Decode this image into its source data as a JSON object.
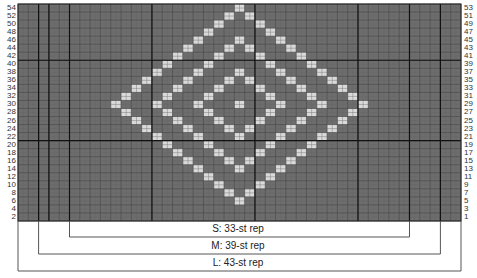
{
  "chart": {
    "columns": 43,
    "rows": 27,
    "left_row_labels": [
      "54",
      "52",
      "50",
      "48",
      "46",
      "44",
      "42",
      "40",
      "38",
      "36",
      "34",
      "32",
      "30",
      "28",
      "26",
      "24",
      "22",
      "20",
      "18",
      "16",
      "14",
      "12",
      "10",
      "8",
      "6",
      "4",
      "2"
    ],
    "right_row_labels": [
      "53",
      "51",
      "49",
      "47",
      "45",
      "43",
      "41",
      "39",
      "37",
      "35",
      "33",
      "31",
      "29",
      "27",
      "25",
      "23",
      "21",
      "19",
      "17",
      "15",
      "13",
      "11",
      "9",
      "7",
      "5",
      "3",
      "1"
    ],
    "colors": {
      "background": "#6d6d6d",
      "motif": "#dadada",
      "grid": "#555555",
      "thick": "#111111"
    },
    "motif": {
      "shape": "concentric-diamonds",
      "center_row": 12,
      "center_col": 21,
      "radii": [
        12,
        8,
        4,
        0
      ]
    },
    "thick_vertical_cols": [
      2,
      3,
      5,
      13,
      23,
      33,
      38,
      41
    ],
    "thick_horizontal_rows": [
      7,
      17
    ]
  },
  "repeats": [
    {
      "label": "S: 33-st rep",
      "start_col": 5,
      "end_col": 38
    },
    {
      "label": "M: 39-st rep",
      "start_col": 2,
      "end_col": 41
    },
    {
      "label": "L: 43-st rep",
      "start_col": 0,
      "end_col": 43
    }
  ]
}
